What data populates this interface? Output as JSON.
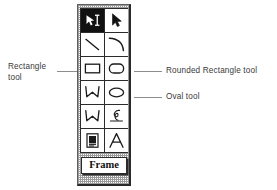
{
  "palette": {
    "name": "drawing-tools-palette",
    "frame_button_label": "Frame",
    "rows": [
      {
        "tools": [
          {
            "id": "selection-pointer-tool",
            "icon": "pointer-ibeam-icon",
            "selected": true
          },
          {
            "id": "arrow-select-tool",
            "icon": "arrow-cursor-icon",
            "selected": false
          }
        ]
      },
      {
        "tools": [
          {
            "id": "line-tool",
            "icon": "line-icon",
            "selected": false
          },
          {
            "id": "arc-tool",
            "icon": "arc-icon",
            "selected": false
          }
        ]
      },
      {
        "tools": [
          {
            "id": "rectangle-tool",
            "icon": "rectangle-icon",
            "selected": false
          },
          {
            "id": "rounded-rectangle-tool",
            "icon": "rounded-rectangle-icon",
            "selected": false
          }
        ]
      },
      {
        "tools": [
          {
            "id": "polygon-tool",
            "icon": "polygon-icon",
            "selected": false
          },
          {
            "id": "oval-tool",
            "icon": "oval-icon",
            "selected": false
          }
        ]
      },
      {
        "tools": [
          {
            "id": "freeform-polygon-tool",
            "icon": "freeform-polygon-icon",
            "selected": false
          },
          {
            "id": "freehand-tool",
            "icon": "scribble-icon",
            "selected": false
          }
        ]
      },
      {
        "tools": [
          {
            "id": "page-object-tool",
            "icon": "document-page-icon",
            "selected": false
          },
          {
            "id": "text-tool",
            "icon": "letter-a-icon",
            "selected": false
          }
        ]
      }
    ]
  },
  "annotations": {
    "rectangle": {
      "text": "Rectangle\ntool",
      "target_tool": "rectangle-tool",
      "side": "left"
    },
    "rounded_rectangle": {
      "text": "Rounded Rectangle tool",
      "target_tool": "rounded-rectangle-tool",
      "side": "right"
    },
    "oval": {
      "text": "Oval tool",
      "target_tool": "oval-tool",
      "side": "right"
    }
  },
  "colors": {
    "background": "#ffffff",
    "ink": "#111111",
    "chrome_dither": "#9b9b9b",
    "label_text": "#3a3a3a",
    "leader_line": "#8d8d8d"
  }
}
